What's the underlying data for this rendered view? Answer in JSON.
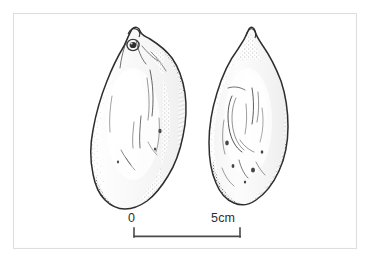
{
  "figure": {
    "kind": "archaeological-line-drawing",
    "medium": "pen-and-ink stipple illustration",
    "background_color": "#ffffff",
    "ink_color": "#3a3a3a",
    "frame_color": "#dedede"
  },
  "artifacts": [
    {
      "id": "artifact-left",
      "label": "left artifact",
      "description": "large ovate cobble tool, broad rounded base, narrow beaked apex with a circular perforation below the tip",
      "orientation": "vertical",
      "features": [
        "pointed beaked apex",
        "circular perforation near apex",
        "stippled shading along right margin",
        "broad rounded base"
      ],
      "bounds": {
        "x": 95,
        "y": 28,
        "width": 92,
        "height": 182
      }
    },
    {
      "id": "artifact-right",
      "label": "right artifact",
      "description": "narrower elongated ovate tool with sharply pointed apex and tapering rounded base",
      "orientation": "vertical",
      "features": [
        "sharp pointed apex",
        "incised flake scars in centre",
        "stippled shading along both margins",
        "tapered rounded base"
      ],
      "bounds": {
        "x": 210,
        "y": 28,
        "width": 78,
        "height": 178
      }
    }
  ],
  "scalebar": {
    "zero_label": "0",
    "max_label": "5cm",
    "unit": "cm",
    "min_value": 0,
    "max_value": 5,
    "length_px": 106,
    "tick_style": "downward end ticks",
    "line_color": "#4a4a4a"
  }
}
